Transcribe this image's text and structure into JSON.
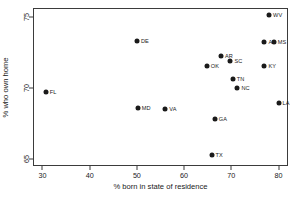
{
  "chart_data": {
    "type": "scatter",
    "title": "",
    "xlabel": "% born in state of residence",
    "ylabel": "% who own home",
    "xlim": [
      28,
      82
    ],
    "ylim": [
      64.5,
      75.6
    ],
    "xticks": [
      30,
      40,
      50,
      60,
      70,
      80
    ],
    "yticks": [
      65,
      70,
      75
    ],
    "grid": false,
    "legend": "none",
    "marker_color": "#1a1a1a",
    "frame_color": "#3b3b3b",
    "background": "#ffffff",
    "points": [
      {
        "label": "FL",
        "x": 30.7,
        "y": 69.7
      },
      {
        "label": "DE",
        "x": 50.0,
        "y": 73.3
      },
      {
        "label": "MD",
        "x": 50.2,
        "y": 68.6
      },
      {
        "label": "VA",
        "x": 56.0,
        "y": 68.5
      },
      {
        "label": "OK",
        "x": 64.8,
        "y": 71.5
      },
      {
        "label": "TX",
        "x": 65.8,
        "y": 65.3
      },
      {
        "label": "GA",
        "x": 66.5,
        "y": 67.8
      },
      {
        "label": "AR",
        "x": 67.8,
        "y": 72.2
      },
      {
        "label": "SC",
        "x": 69.8,
        "y": 71.9
      },
      {
        "label": "TN",
        "x": 70.3,
        "y": 70.6
      },
      {
        "label": "NC",
        "x": 71.3,
        "y": 70.0
      },
      {
        "label": "AL",
        "x": 77.0,
        "y": 73.2
      },
      {
        "label": "KY",
        "x": 77.0,
        "y": 71.5
      },
      {
        "label": "WV",
        "x": 78.0,
        "y": 75.1
      },
      {
        "label": "MS",
        "x": 79.0,
        "y": 73.2
      },
      {
        "label": "LA",
        "x": 80.0,
        "y": 68.9
      }
    ]
  }
}
